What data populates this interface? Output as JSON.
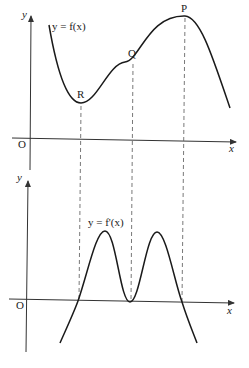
{
  "top_graph": {
    "y_axis_label": "y",
    "x_axis_label": "x",
    "origin_label": "O",
    "curve_label": "y = f(x)",
    "points": [
      {
        "name": "R",
        "type": "minimum"
      },
      {
        "name": "Q",
        "type": "point of inflection"
      },
      {
        "name": "P",
        "type": "maximum"
      }
    ]
  },
  "bottom_graph": {
    "y_axis_label": "y",
    "x_axis_label": "x",
    "origin_label": "O",
    "curve_label": "y = f'(x)"
  },
  "colors": {
    "curve": "#1a1a1a",
    "axis": "#333333",
    "dashed": "#555555"
  }
}
